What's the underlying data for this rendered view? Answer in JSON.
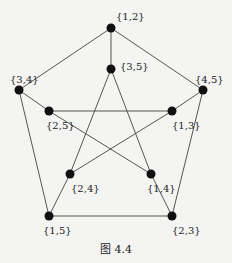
{
  "figure": {
    "caption": "图 4.4",
    "vertices": [
      {
        "id": "12",
        "label": "{1,2}",
        "x": 111,
        "y": 28,
        "lx": 116,
        "ly": 12
      },
      {
        "id": "35",
        "label": "{3,5}",
        "x": 111,
        "y": 69,
        "lx": 120,
        "ly": 62
      },
      {
        "id": "34",
        "label": "{3,4}",
        "x": 19,
        "y": 90,
        "lx": 10,
        "ly": 75
      },
      {
        "id": "45",
        "label": "{4,5}",
        "x": 203,
        "y": 90,
        "lx": 195,
        "ly": 75
      },
      {
        "id": "25",
        "label": "{2,5}",
        "x": 49,
        "y": 111,
        "lx": 46,
        "ly": 121
      },
      {
        "id": "13",
        "label": "{1,3}",
        "x": 172,
        "y": 111,
        "lx": 172,
        "ly": 121
      },
      {
        "id": "24",
        "label": "{2,4}",
        "x": 70,
        "y": 174,
        "lx": 71,
        "ly": 184
      },
      {
        "id": "14",
        "label": "{1,4}",
        "x": 151,
        "y": 174,
        "lx": 147,
        "ly": 184
      },
      {
        "id": "15",
        "label": "{1,5}",
        "x": 49,
        "y": 216,
        "lx": 43,
        "ly": 226
      },
      {
        "id": "23",
        "label": "{2,3}",
        "x": 172,
        "y": 216,
        "lx": 172,
        "ly": 226
      }
    ],
    "edges": [
      [
        "12",
        "34"
      ],
      [
        "12",
        "45"
      ],
      [
        "34",
        "15"
      ],
      [
        "45",
        "23"
      ],
      [
        "15",
        "23"
      ],
      [
        "12",
        "35"
      ],
      [
        "34",
        "25"
      ],
      [
        "45",
        "13"
      ],
      [
        "15",
        "24"
      ],
      [
        "23",
        "14"
      ],
      [
        "35",
        "24"
      ],
      [
        "35",
        "14"
      ],
      [
        "25",
        "13"
      ],
      [
        "25",
        "14"
      ],
      [
        "13",
        "24"
      ]
    ],
    "colors": {
      "edge": "#555555",
      "vertex": "#111111"
    }
  }
}
